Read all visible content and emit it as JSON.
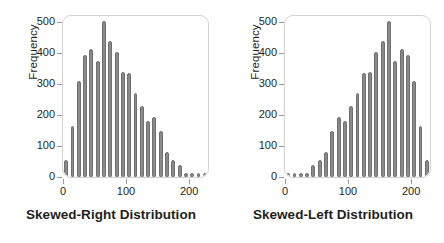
{
  "figure": {
    "background": "#ffffff",
    "bar_color": "#8a8a8a",
    "bar_edge_color": "#6f6f6f",
    "frame_color": "#d2d2d2",
    "text_color": "#231f20"
  },
  "panels": [
    {
      "id": "skewed-right",
      "caption": "Skewed-Right Distribution",
      "ylabel": "Frequency",
      "ytick_labels": [
        "0",
        "100",
        "200",
        "300",
        "400",
        "500"
      ],
      "xtick_labels": [
        "0",
        "100",
        "200"
      ]
    },
    {
      "id": "skewed-left",
      "caption": "Skewed-Left Distribution",
      "ylabel": "Frequency",
      "ytick_labels": [
        "0",
        "100",
        "200",
        "300",
        "400",
        "500"
      ],
      "xtick_labels": [
        "0",
        "100",
        "200"
      ]
    }
  ],
  "chart_data": [
    {
      "type": "bar",
      "title": "Skewed-Right Distribution",
      "xlabel": "",
      "ylabel": "Frequency",
      "ylim": [
        0,
        520
      ],
      "xlim": [
        0,
        230
      ],
      "grid": false,
      "legend": "none",
      "bin_width": 10,
      "categories": [
        5,
        15,
        25,
        35,
        45,
        55,
        65,
        75,
        85,
        95,
        105,
        115,
        125,
        135,
        145,
        155,
        165,
        175,
        185,
        195,
        205,
        215,
        225
      ],
      "values": [
        55,
        165,
        310,
        395,
        415,
        375,
        505,
        440,
        405,
        340,
        335,
        270,
        230,
        180,
        195,
        150,
        80,
        55,
        40,
        12,
        10,
        10,
        10
      ]
    },
    {
      "type": "bar",
      "title": "Skewed-Left Distribution",
      "xlabel": "",
      "ylabel": "Frequency",
      "ylim": [
        0,
        520
      ],
      "xlim": [
        0,
        230
      ],
      "grid": false,
      "legend": "none",
      "bin_width": 10,
      "categories": [
        5,
        15,
        25,
        35,
        45,
        55,
        65,
        75,
        85,
        95,
        105,
        115,
        125,
        135,
        145,
        155,
        165,
        175,
        185,
        195,
        205,
        215,
        225
      ],
      "values": [
        10,
        10,
        10,
        12,
        40,
        55,
        80,
        150,
        195,
        180,
        230,
        270,
        335,
        340,
        405,
        440,
        505,
        375,
        415,
        395,
        310,
        165,
        55
      ]
    }
  ]
}
